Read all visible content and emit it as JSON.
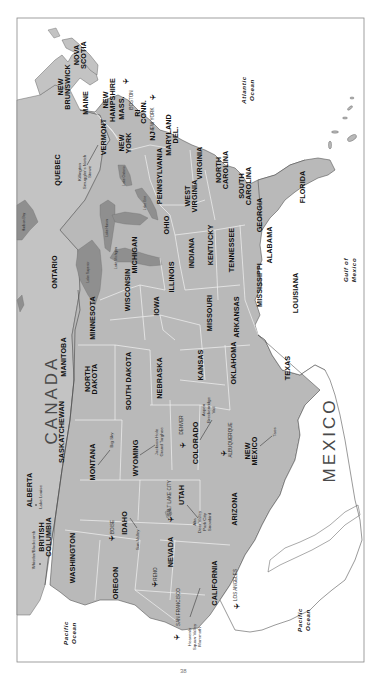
{
  "map": {
    "orientation": "rotated-90-ccw-text",
    "colors": {
      "land": "#b9b9b9",
      "land_canada": "#c4c4c4",
      "lake": "#8f8f8f",
      "water": "#ffffff",
      "border": "#f2f2f2",
      "coast": "#555555",
      "frame": "#888888"
    },
    "countries": {
      "canada": "CANADA",
      "mexico": "MEXICO"
    },
    "oceans": {
      "atlantic_1": "Atlantic",
      "atlantic_2": "Ocean",
      "gulf_1": "Gulf of",
      "gulf_2": "Mexico",
      "pacific_a1": "Pacific",
      "pacific_a2": "Ocean",
      "pacific_b1": "Pacific",
      "pacific_b2": "Ocean"
    },
    "provinces": {
      "nova_scotia_1": "NOVA",
      "nova_scotia_2": "SCOTIA",
      "new_brunswick_1": "NEW",
      "new_brunswick_2": "BRUNSWICK",
      "quebec": "QUEBEC",
      "ontario": "ONTARIO",
      "manitoba": "MANITOBA",
      "saskatchewan": "SASKATCHEWAN",
      "alberta": "ALBERTA",
      "british_columbia_1": "BRITISH",
      "british_columbia_2": "COLUMBIA"
    },
    "states": {
      "maine": "MAINE",
      "new_hampshire_1": "NEW",
      "new_hampshire_2": "HAMPSHIRE",
      "vermont": "VERMONT",
      "mass": "MASS.",
      "ri": "RI",
      "conn": "CONN.",
      "new_york_1": "NEW",
      "new_york_2": "YORK",
      "nj": "NJ",
      "maryland": "MARYLAND",
      "del": "DEL.",
      "pennsylvania": "PENNSYLVANIA",
      "west_virginia_1": "WEST",
      "west_virginia_2": "VIRGINIA",
      "virginia": "VIRGINIA",
      "north_carolina_1": "NORTH",
      "north_carolina_2": "CAROLINA",
      "south_carolina_1": "SOUTH",
      "south_carolina_2": "CAROLINA",
      "georgia": "GEORGIA",
      "florida": "FLORIDA",
      "ohio": "OHIO",
      "michigan": "MICHIGAN",
      "indiana": "INDIANA",
      "kentucky": "KENTUCKY",
      "tennessee": "TENNESSEE",
      "alabama": "ALABAMA",
      "mississippi": "MISSISSIPPI",
      "louisiana": "LOUISIANA",
      "wisconsin": "WISCONSIN",
      "illinois": "ILLINOIS",
      "missouri": "MISSOURI",
      "arkansas": "ARKANSAS",
      "minnesota": "MINNESOTA",
      "iowa": "IOWA",
      "north_dakota_1": "NORTH",
      "north_dakota_2": "DAKOTA",
      "south_dakota": "SOUTH DAKOTA",
      "nebraska": "NEBRASKA",
      "kansas": "KANSAS",
      "oklahoma": "OKLAHOMA",
      "texas": "TEXAS",
      "montana": "MONTANA",
      "wyoming": "WYOMING",
      "colorado": "COLORADO",
      "new_mexico_1": "NEW",
      "new_mexico_2": "MEXICO",
      "idaho": "IDAHO",
      "utah": "UTAH",
      "arizona": "ARIZONA",
      "washington": "WASHINGTON",
      "oregon": "OREGON",
      "nevada": "NEVADA",
      "california": "CALIFORNIA"
    },
    "cities": {
      "boston": "BOSTON",
      "new_york": "NEW YORK",
      "denver": "DENVER",
      "albuquerque": "ALBUQUERQUE",
      "salt_lake_city": "SALT LAKE CITY",
      "boise": "BOISE",
      "reno": "RENO",
      "san_francisco": "SAN FRANCISCO",
      "los_angeles": "LOS ANGELES"
    },
    "resorts": {
      "killington_1": "Killington",
      "killington_2": "Smuggler's Notch",
      "killington_3": "Stowe",
      "big_sky": "Big Sky",
      "jackson_1": "Jackson Hole",
      "jackson_2": "Grand Targhee",
      "colorado_1": "Aspen",
      "colorado_2": "Breckenridge",
      "colorado_3": "Vail",
      "taos": "Taos",
      "utah_1": "Alta",
      "utah_2": "Deer Valley",
      "utah_3": "Park City",
      "utah_4": "Snowbird",
      "sun_valley": "Sun Valley",
      "lake_louise": "Lake Louise",
      "whistler": "Whistler/Blackcomb",
      "ca_1": "Heavenly",
      "ca_2": "Squaw Valley",
      "ca_3": "Mammoth"
    },
    "lakes": {
      "superior": "Lake Superior",
      "michigan": "Lake Michigan",
      "huron": "Lake Huron",
      "erie": "Lake Erie",
      "ontario": "Lake Ontario",
      "hudson": "Hudson Bay",
      "winnipeg": "Lake Winnipeg"
    },
    "airport_icon": "✈"
  },
  "page": {
    "number": "38"
  }
}
